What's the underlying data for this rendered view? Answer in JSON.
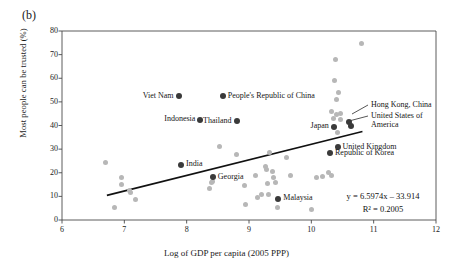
{
  "figure": {
    "panel_label": "(b)"
  },
  "chart_data": {
    "type": "scatter",
    "title": "",
    "xlabel": "Log of GDP per capita (2005 PPP)",
    "ylabel": "Most people can be trusted (%)",
    "xlim": [
      6,
      12
    ],
    "ylim": [
      0,
      80
    ],
    "xticks": [
      6,
      7,
      8,
      9,
      10,
      11,
      12
    ],
    "yticks": [
      0,
      10,
      20,
      30,
      40,
      50,
      60,
      70,
      80
    ],
    "grid": false,
    "legend": "none",
    "trendline": {
      "equation": "y = 6.5974x – 33.914",
      "r_squared": "R² = 0.2005",
      "slope": 6.5974,
      "intercept": -33.914,
      "x_start": 6.72,
      "x_end": 10.82
    },
    "labeled_points": [
      {
        "label": "Viet Nam",
        "x": 7.87,
        "y": 52.3,
        "label_side": "left"
      },
      {
        "label": "People's Republic of China",
        "x": 8.58,
        "y": 52.3,
        "label_side": "right"
      },
      {
        "label": "Indonesia",
        "x": 8.22,
        "y": 42.4,
        "label_side": "left"
      },
      {
        "label": "Thailand",
        "x": 8.8,
        "y": 41.7,
        "label_side": "left"
      },
      {
        "label": "Japan",
        "x": 10.36,
        "y": 39.4,
        "label_side": "left"
      },
      {
        "label": "Hong Kong, China",
        "x": 10.6,
        "y": 41.3,
        "label_side": "leader"
      },
      {
        "label": "United States of America",
        "x": 10.64,
        "y": 39.6,
        "label_side": "leader"
      },
      {
        "label": "United Kingdom",
        "x": 10.42,
        "y": 30.8,
        "label_side": "right"
      },
      {
        "label": "Republic of Korea",
        "x": 10.3,
        "y": 28.2,
        "label_side": "right"
      },
      {
        "label": "India",
        "x": 7.91,
        "y": 23.4,
        "label_side": "right"
      },
      {
        "label": "Georgia",
        "x": 8.42,
        "y": 18.0,
        "label_side": "right"
      },
      {
        "label": "Malaysia",
        "x": 9.47,
        "y": 9.1,
        "label_side": "right"
      }
    ],
    "unlabeled_points": [
      {
        "x": 6.7,
        "y": 24.5
      },
      {
        "x": 6.85,
        "y": 5.2
      },
      {
        "x": 6.95,
        "y": 18.0
      },
      {
        "x": 6.96,
        "y": 15.0
      },
      {
        "x": 7.08,
        "y": 12.4
      },
      {
        "x": 7.1,
        "y": 11.7
      },
      {
        "x": 7.18,
        "y": 8.8
      },
      {
        "x": 8.52,
        "y": 31.2
      },
      {
        "x": 8.42,
        "y": 16.2
      },
      {
        "x": 8.4,
        "y": 15.9
      },
      {
        "x": 8.37,
        "y": 13.3
      },
      {
        "x": 8.8,
        "y": 27.8
      },
      {
        "x": 8.92,
        "y": 14.7
      },
      {
        "x": 8.95,
        "y": 6.5
      },
      {
        "x": 9.1,
        "y": 18.9
      },
      {
        "x": 9.14,
        "y": 9.7
      },
      {
        "x": 9.2,
        "y": 10.6
      },
      {
        "x": 9.27,
        "y": 22.8
      },
      {
        "x": 9.28,
        "y": 21.3
      },
      {
        "x": 9.3,
        "y": 15.4
      },
      {
        "x": 9.31,
        "y": 10.9
      },
      {
        "x": 9.33,
        "y": 28.6
      },
      {
        "x": 9.38,
        "y": 20.7
      },
      {
        "x": 9.4,
        "y": 18.0
      },
      {
        "x": 9.42,
        "y": 15.7
      },
      {
        "x": 9.46,
        "y": 5.1
      },
      {
        "x": 9.6,
        "y": 26.3
      },
      {
        "x": 9.67,
        "y": 19.0
      },
      {
        "x": 10.0,
        "y": 4.3
      },
      {
        "x": 10.09,
        "y": 18.0
      },
      {
        "x": 10.18,
        "y": 18.4
      },
      {
        "x": 10.28,
        "y": 20.3
      },
      {
        "x": 10.33,
        "y": 18.9
      },
      {
        "x": 10.38,
        "y": 68.0
      },
      {
        "x": 10.37,
        "y": 59.0
      },
      {
        "x": 10.44,
        "y": 54.0
      },
      {
        "x": 10.4,
        "y": 51.0
      },
      {
        "x": 10.33,
        "y": 46.0
      },
      {
        "x": 10.4,
        "y": 44.8
      },
      {
        "x": 10.46,
        "y": 45.0
      },
      {
        "x": 10.36,
        "y": 43.0
      },
      {
        "x": 10.46,
        "y": 42.5
      },
      {
        "x": 10.42,
        "y": 37.0
      },
      {
        "x": 10.8,
        "y": 74.5
      }
    ]
  }
}
